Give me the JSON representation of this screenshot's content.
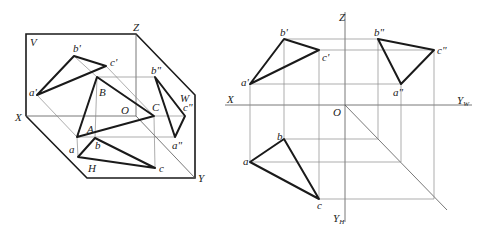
{
  "figure": {
    "colors": {
      "line": "#1a1a1a",
      "construction": "#8a8a8a",
      "background": "#ffffff"
    }
  },
  "left_view": {
    "title": "Axonometric (3D) projection",
    "planes": {
      "v": "V",
      "h": "H",
      "w": "W"
    },
    "axes": {
      "x": "X",
      "y": "Y",
      "z": "Z",
      "origin": "O"
    },
    "space_points": {
      "a": "A",
      "b": "B",
      "c": "C"
    },
    "v_projection": {
      "a": "a'",
      "b": "b'",
      "c": "c'"
    },
    "h_projection": {
      "a": "a",
      "b": "b",
      "c": "c"
    },
    "w_projection": {
      "a": "a\"",
      "b": "b\"",
      "c": "c\""
    }
  },
  "right_view": {
    "title": "Orthographic (unfolded) projection",
    "axes": {
      "x": "X",
      "z": "Z",
      "origin": "O",
      "yw": "Y",
      "yw_sub": "W",
      "yh": "Y",
      "yh_sub": "H"
    },
    "v_projection": {
      "a": "a'",
      "b": "b'",
      "c": "c'"
    },
    "h_projection": {
      "a": "a",
      "b": "b",
      "c": "c"
    },
    "w_projection": {
      "a": "a\"",
      "b": "b\"",
      "c": "c\""
    }
  }
}
